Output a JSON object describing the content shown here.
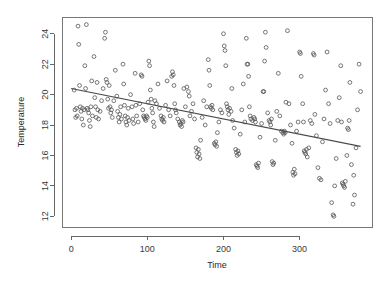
{
  "chart_data": {
    "type": "scatter",
    "title": "",
    "xlabel": "Time",
    "ylabel": "Temperature",
    "xlim": [
      -12,
      395
    ],
    "ylim": [
      11.3,
      25.1
    ],
    "xticks": [
      0,
      100,
      200,
      300
    ],
    "yticks": [
      12,
      14,
      16,
      18,
      20,
      22,
      24
    ],
    "xtick_labels": [
      "0",
      "100",
      "200",
      "300"
    ],
    "ytick_labels": [
      "12",
      "14",
      "16",
      "18",
      "20",
      "22",
      "24"
    ],
    "grid": false,
    "legend": null,
    "marker": "open-circle",
    "marker_color": "#555555",
    "point_radius": 1.9,
    "trendline": {
      "type": "linear-regression",
      "color": "#4a4a4a",
      "x_start": 0,
      "y_start": 20.4,
      "x_end": 380,
      "y_end": 16.6,
      "slope": -0.01,
      "intercept": 20.4
    },
    "series": [
      {
        "name": "Temperature observations",
        "points": [
          [
            4,
            20.3
          ],
          [
            5,
            19.0
          ],
          [
            6,
            18.5
          ],
          [
            7,
            19.1
          ],
          [
            8,
            18.6
          ],
          [
            9,
            24.5
          ],
          [
            10,
            23.3
          ],
          [
            11,
            20.6
          ],
          [
            12,
            19.2
          ],
          [
            13,
            18.9
          ],
          [
            14,
            18.4
          ],
          [
            15,
            19.1
          ],
          [
            16,
            18.0
          ],
          [
            17,
            19.0
          ],
          [
            18,
            21.9
          ],
          [
            19,
            20.4
          ],
          [
            20,
            24.6
          ],
          [
            21,
            19.1
          ],
          [
            22,
            19.0
          ],
          [
            23,
            18.8
          ],
          [
            24,
            18.3
          ],
          [
            25,
            17.9
          ],
          [
            26,
            19.2
          ],
          [
            27,
            20.9
          ],
          [
            28,
            18.6
          ],
          [
            30,
            22.5
          ],
          [
            31,
            19.8
          ],
          [
            32,
            19.2
          ],
          [
            33,
            18.5
          ],
          [
            34,
            20.8
          ],
          [
            35,
            19.0
          ],
          [
            36,
            18.4
          ],
          [
            38,
            18.9
          ],
          [
            40,
            19.6
          ],
          [
            42,
            20.4
          ],
          [
            44,
            23.7
          ],
          [
            45,
            24.1
          ],
          [
            46,
            21.0
          ],
          [
            47,
            20.8
          ],
          [
            48,
            19.7
          ],
          [
            49,
            19.1
          ],
          [
            50,
            20.6
          ],
          [
            51,
            19.2
          ],
          [
            52,
            18.8
          ],
          [
            53,
            19.0
          ],
          [
            54,
            18.5
          ],
          [
            56,
            19.6
          ],
          [
            58,
            21.6
          ],
          [
            60,
            19.9
          ],
          [
            61,
            18.9
          ],
          [
            62,
            18.5
          ],
          [
            63,
            18.2
          ],
          [
            64,
            18.7
          ],
          [
            65,
            19.2
          ],
          [
            66,
            18.4
          ],
          [
            68,
            22.0
          ],
          [
            69,
            20.7
          ],
          [
            70,
            19.3
          ],
          [
            71,
            18.6
          ],
          [
            72,
            18.2
          ],
          [
            73,
            18.0
          ],
          [
            74,
            18.5
          ],
          [
            75,
            19.1
          ],
          [
            76,
            18.3
          ],
          [
            78,
            20.0
          ],
          [
            80,
            19.2
          ],
          [
            81,
            18.4
          ],
          [
            82,
            18.1
          ],
          [
            84,
            21.4
          ],
          [
            85,
            19.3
          ],
          [
            86,
            18.6
          ],
          [
            88,
            18.2
          ],
          [
            90,
            19.4
          ],
          [
            92,
            21.3
          ],
          [
            93,
            21.2
          ],
          [
            94,
            19.0
          ],
          [
            95,
            18.6
          ],
          [
            96,
            18.5
          ],
          [
            97,
            18.4
          ],
          [
            98,
            18.3
          ],
          [
            99,
            18.6
          ],
          [
            100,
            18.5
          ],
          [
            101,
            19.5
          ],
          [
            102,
            22.2
          ],
          [
            103,
            21.9
          ],
          [
            104,
            20.3
          ],
          [
            105,
            19.7
          ],
          [
            106,
            19.1
          ],
          [
            107,
            18.8
          ],
          [
            108,
            18.2
          ],
          [
            109,
            17.9
          ],
          [
            110,
            19.6
          ],
          [
            112,
            19.4
          ],
          [
            114,
            20.7
          ],
          [
            116,
            19.1
          ],
          [
            118,
            18.6
          ],
          [
            119,
            18.4
          ],
          [
            120,
            18.3
          ],
          [
            121,
            18.5
          ],
          [
            122,
            18.2
          ],
          [
            124,
            19.3
          ],
          [
            126,
            20.9
          ],
          [
            128,
            19.0
          ],
          [
            130,
            18.6
          ],
          [
            132,
            21.2
          ],
          [
            133,
            21.5
          ],
          [
            134,
            21.3
          ],
          [
            135,
            20.6
          ],
          [
            136,
            19.4
          ],
          [
            137,
            19.0
          ],
          [
            138,
            18.8
          ],
          [
            140,
            18.4
          ],
          [
            142,
            18.2
          ],
          [
            143,
            18.0
          ],
          [
            144,
            18.1
          ],
          [
            145,
            17.9
          ],
          [
            146,
            18.3
          ],
          [
            147,
            18.2
          ],
          [
            148,
            20.4
          ],
          [
            150,
            19.2
          ],
          [
            152,
            20.5
          ],
          [
            154,
            20.2
          ],
          [
            155,
            19.9
          ],
          [
            156,
            18.6
          ],
          [
            158,
            18.9
          ],
          [
            160,
            19.4
          ],
          [
            162,
            18.4
          ],
          [
            164,
            16.5
          ],
          [
            165,
            16.2
          ],
          [
            166,
            15.9
          ],
          [
            167,
            16.4
          ],
          [
            168,
            16.1
          ],
          [
            169,
            15.8
          ],
          [
            170,
            17.0
          ],
          [
            172,
            18.5
          ],
          [
            174,
            19.6
          ],
          [
            176,
            18.0
          ],
          [
            178,
            19.2
          ],
          [
            180,
            22.3
          ],
          [
            181,
            21.6
          ],
          [
            182,
            20.6
          ],
          [
            183,
            19.2
          ],
          [
            184,
            19.1
          ],
          [
            185,
            19.3
          ],
          [
            186,
            19.0
          ],
          [
            188,
            16.8
          ],
          [
            189,
            16.7
          ],
          [
            190,
            16.9
          ],
          [
            191,
            16.6
          ],
          [
            192,
            17.5
          ],
          [
            194,
            18.2
          ],
          [
            196,
            19.0
          ],
          [
            198,
            18.8
          ],
          [
            200,
            24.0
          ],
          [
            201,
            23.2
          ],
          [
            202,
            22.9
          ],
          [
            203,
            21.9
          ],
          [
            204,
            19.4
          ],
          [
            205,
            19.2
          ],
          [
            206,
            19.0
          ],
          [
            207,
            18.7
          ],
          [
            208,
            19.1
          ],
          [
            210,
            18.9
          ],
          [
            211,
            20.4
          ],
          [
            212,
            18.3
          ],
          [
            214,
            17.8
          ],
          [
            216,
            16.4
          ],
          [
            217,
            16.2
          ],
          [
            218,
            16.0
          ],
          [
            219,
            16.3
          ],
          [
            220,
            16.1
          ],
          [
            222,
            17.4
          ],
          [
            224,
            19.0
          ],
          [
            226,
            20.7
          ],
          [
            228,
            18.2
          ],
          [
            230,
            23.7
          ],
          [
            231,
            22.0
          ],
          [
            232,
            22.0
          ],
          [
            233,
            21.2
          ],
          [
            234,
            19.2
          ],
          [
            235,
            18.6
          ],
          [
            236,
            18.4
          ],
          [
            238,
            18.3
          ],
          [
            240,
            18.5
          ],
          [
            241,
            18.4
          ],
          [
            242,
            18.2
          ],
          [
            243,
            15.4
          ],
          [
            244,
            15.3
          ],
          [
            245,
            15.2
          ],
          [
            246,
            15.5
          ],
          [
            248,
            17.2
          ],
          [
            250,
            18.1
          ],
          [
            252,
            20.2
          ],
          [
            253,
            20.2
          ],
          [
            254,
            22.2
          ],
          [
            255,
            24.1
          ],
          [
            256,
            23.1
          ],
          [
            258,
            18.8
          ],
          [
            260,
            18.3
          ],
          [
            261,
            18.2
          ],
          [
            262,
            18.0
          ],
          [
            263,
            18.4
          ],
          [
            264,
            15.6
          ],
          [
            265,
            15.4
          ],
          [
            266,
            15.5
          ],
          [
            268,
            17.0
          ],
          [
            270,
            18.9
          ],
          [
            272,
            21.4
          ],
          [
            274,
            18.6
          ],
          [
            276,
            17.6
          ],
          [
            278,
            17.5
          ],
          [
            279,
            17.4
          ],
          [
            280,
            17.6
          ],
          [
            281,
            17.5
          ],
          [
            282,
            19.5
          ],
          [
            284,
            24.2
          ],
          [
            286,
            19.4
          ],
          [
            288,
            18.0
          ],
          [
            290,
            16.8
          ],
          [
            291,
            14.9
          ],
          [
            292,
            14.7
          ],
          [
            293,
            15.1
          ],
          [
            294,
            14.8
          ],
          [
            296,
            17.6
          ],
          [
            298,
            18.2
          ],
          [
            300,
            22.8
          ],
          [
            301,
            22.7
          ],
          [
            302,
            21.2
          ],
          [
            304,
            19.4
          ],
          [
            305,
            18.2
          ],
          [
            306,
            16.3
          ],
          [
            307,
            16.2
          ],
          [
            308,
            16.1
          ],
          [
            309,
            16.4
          ],
          [
            310,
            15.9
          ],
          [
            312,
            16.5
          ],
          [
            314,
            18.3
          ],
          [
            316,
            18.1
          ],
          [
            318,
            22.7
          ],
          [
            319,
            22.6
          ],
          [
            320,
            18.7
          ],
          [
            322,
            17.3
          ],
          [
            324,
            15.2
          ],
          [
            326,
            14.5
          ],
          [
            328,
            14.4
          ],
          [
            330,
            16.9
          ],
          [
            332,
            18.4
          ],
          [
            334,
            20.3
          ],
          [
            336,
            22.8
          ],
          [
            338,
            19.4
          ],
          [
            340,
            18.1
          ],
          [
            342,
            12.9
          ],
          [
            344,
            12.1
          ],
          [
            345,
            12.0
          ],
          [
            346,
            14.0
          ],
          [
            348,
            15.8
          ],
          [
            350,
            18.3
          ],
          [
            352,
            19.8
          ],
          [
            354,
            21.9
          ],
          [
            355,
            18.2
          ],
          [
            356,
            14.2
          ],
          [
            357,
            14.1
          ],
          [
            358,
            14.0
          ],
          [
            359,
            13.9
          ],
          [
            360,
            14.3
          ],
          [
            362,
            16.0
          ],
          [
            363,
            17.8
          ],
          [
            364,
            17.7
          ],
          [
            365,
            18.3
          ],
          [
            366,
            20.8
          ],
          [
            368,
            15.4
          ],
          [
            370,
            12.8
          ],
          [
            371,
            14.7
          ],
          [
            372,
            13.4
          ],
          [
            374,
            16.5
          ],
          [
            376,
            19.0
          ],
          [
            378,
            22.0
          ],
          [
            380,
            20.2
          ]
        ]
      }
    ]
  },
  "plot": {
    "xlabel": "Time",
    "ylabel": "Temperature"
  }
}
